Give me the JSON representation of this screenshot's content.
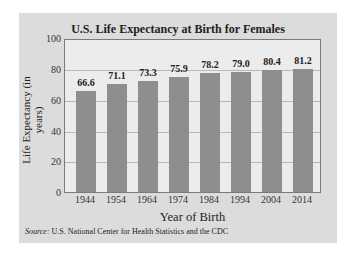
{
  "chart_data": {
    "type": "bar",
    "title": "U.S. Life Expectancy at Birth for Females",
    "xlabel": "Year of Birth",
    "ylabel": "Life Expectancy (in years)",
    "categories": [
      "1944",
      "1954",
      "1964",
      "1974",
      "1984",
      "1994",
      "2004",
      "2014"
    ],
    "values": [
      66.6,
      71.1,
      73.3,
      75.9,
      78.2,
      79.0,
      80.4,
      81.2
    ],
    "value_labels": [
      "66.6",
      "71.1",
      "73.3",
      "75.9",
      "78.2",
      "79.0",
      "80.4",
      "81.2"
    ],
    "ylim": [
      0,
      100
    ],
    "yticks": [
      "0",
      "20",
      "40",
      "60",
      "80",
      "100"
    ],
    "grid": true,
    "legend": null,
    "bar_color": "#8e8e8e",
    "source_label": "Source:",
    "source_text": "U.S. National Center for Health Statistics and the CDC"
  }
}
